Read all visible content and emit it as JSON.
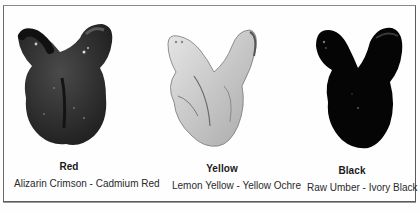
{
  "figure": {
    "swatches": [
      {
        "name": "Red",
        "mix": "Alizarin Crimson - Cadmium Red",
        "tone": "#2a2a2a"
      },
      {
        "name": "Yellow",
        "mix": "Lemon Yellow - Yellow Ochre",
        "tone": "#c8c8c8"
      },
      {
        "name": "Black",
        "mix": "Raw Umber - Ivory Black",
        "tone": "#080808"
      }
    ]
  }
}
